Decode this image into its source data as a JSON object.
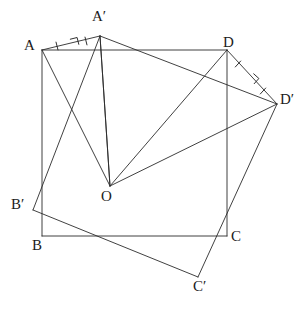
{
  "figure": {
    "stroke_color": "#2b2b2b",
    "label_color": "#1b1b1b",
    "background_color": "#ffffff",
    "stroke_width": 0.9
  },
  "labels": {
    "A": "A",
    "A_prime": "A′",
    "B": "B",
    "B_prime": "B′",
    "C": "C",
    "C_prime": "C′",
    "D": "D",
    "D_prime": "D′",
    "O": "O"
  },
  "points": {
    "A": {
      "x": 42,
      "y": 50
    },
    "B": {
      "x": 42,
      "y": 236
    },
    "C": {
      "x": 227,
      "y": 236
    },
    "D": {
      "x": 227,
      "y": 50
    },
    "A_prime": {
      "x": 100,
      "y": 36
    },
    "B_prime": {
      "x": 33,
      "y": 210
    },
    "C_prime": {
      "x": 198,
      "y": 277
    },
    "D_prime": {
      "x": 277,
      "y": 104
    },
    "O": {
      "x": 110,
      "y": 186
    }
  },
  "label_positions": {
    "A": {
      "x": 24,
      "y": 38
    },
    "B": {
      "x": 32,
      "y": 238
    },
    "C": {
      "x": 231,
      "y": 229
    },
    "D": {
      "x": 223,
      "y": 35
    },
    "A_prime": {
      "x": 92,
      "y": 9
    },
    "B_prime": {
      "x": 11,
      "y": 197
    },
    "C_prime": {
      "x": 193,
      "y": 279
    },
    "D_prime": {
      "x": 280,
      "y": 92
    },
    "O": {
      "x": 101,
      "y": 189
    }
  },
  "segments": [
    {
      "name": "square-side-AB",
      "from": "A",
      "to": "B"
    },
    {
      "name": "square-side-BC",
      "from": "B",
      "to": "C"
    },
    {
      "name": "square-side-CD",
      "from": "C",
      "to": "D"
    },
    {
      "name": "square-side-DA",
      "from": "D",
      "to": "A"
    },
    {
      "name": "rotated-side-ApBp",
      "from": "A_prime",
      "to": "B_prime"
    },
    {
      "name": "rotated-side-BpCp",
      "from": "B_prime",
      "to": "C_prime"
    },
    {
      "name": "rotated-side-CpDp",
      "from": "C_prime",
      "to": "D_prime"
    },
    {
      "name": "rotated-side-DpAp",
      "from": "D_prime",
      "to": "A_prime"
    },
    {
      "name": "radius-OA",
      "from": "O",
      "to": "A"
    },
    {
      "name": "radius-OAp",
      "from": "O",
      "to": "A_prime"
    },
    {
      "name": "radius-OD",
      "from": "O",
      "to": "D"
    },
    {
      "name": "radius-ODp",
      "from": "O",
      "to": "D_prime"
    },
    {
      "name": "chord-A-Ap",
      "from": "A",
      "to": "A_prime"
    },
    {
      "name": "chord-D-Dp",
      "from": "D",
      "to": "D_prime"
    },
    {
      "name": "diagonal-Ap-O",
      "from": "A_prime",
      "to": "O"
    }
  ],
  "marks": {
    "right_angle_A": {
      "name": "right-angle-mark-at-A-chord",
      "x": 72,
      "y": 46,
      "size": 7,
      "rotation": -14
    },
    "right_angle_D": {
      "name": "right-angle-mark-at-D-chord",
      "x": 249,
      "y": 79,
      "size": 7,
      "rotation": 42
    },
    "ticks_A_side": {
      "name": "congruence-tick-A-half",
      "x": 57,
      "y": 46,
      "rotation": -14
    },
    "ticks_Ap_side": {
      "name": "congruence-tick-Ap-half",
      "x": 86,
      "y": 41,
      "rotation": -14
    },
    "ticks_D_side": {
      "name": "congruence-tick-D-half",
      "x": 238,
      "y": 64,
      "rotation": 42
    },
    "ticks_Dp_side": {
      "name": "congruence-tick-Dp-half",
      "x": 263,
      "y": 91,
      "rotation": 42
    }
  }
}
